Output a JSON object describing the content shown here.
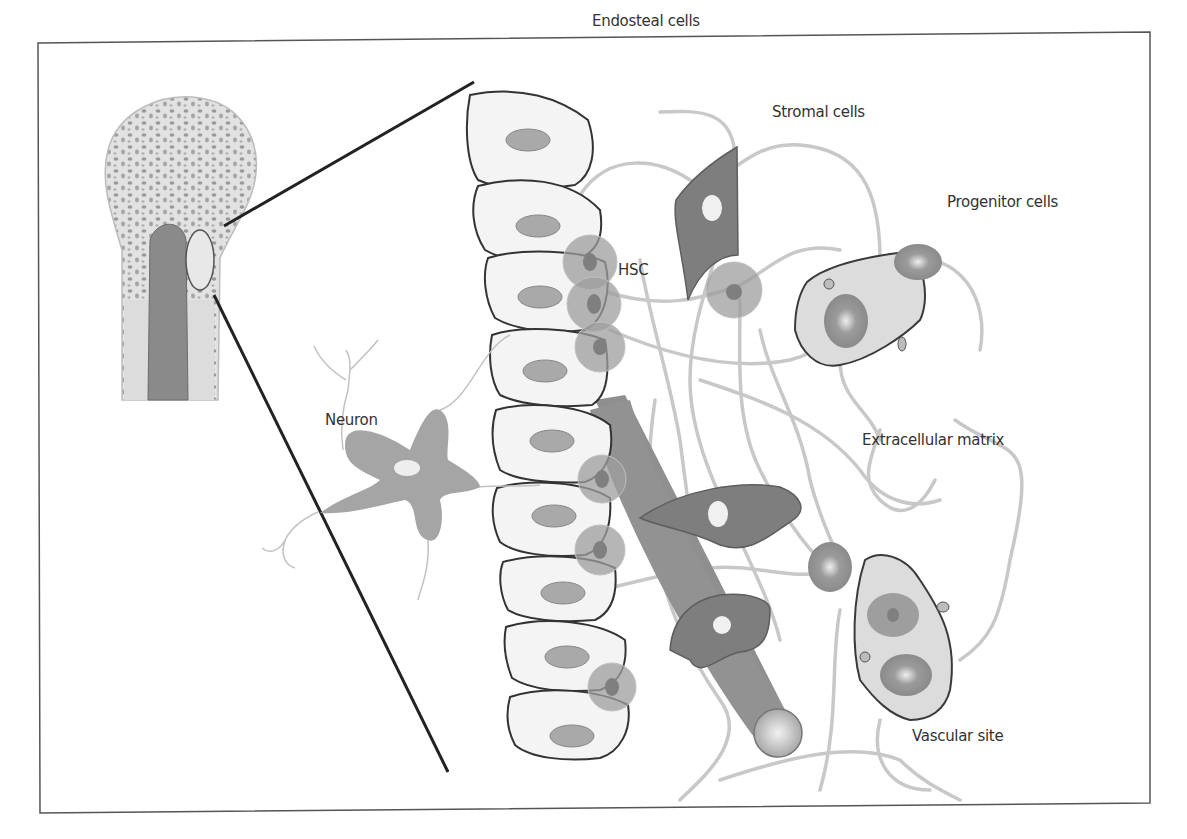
{
  "figure": {
    "type": "illustration",
    "colors": {
      "frame": "#555555",
      "cell_outline": "#3a3a3a",
      "cell_fill": "#f4f4f4",
      "nucleus": "#a9a9a9",
      "hsc": "#9a9a9a",
      "stromal": "#7e7e7e",
      "neuron": "#a5a5a5",
      "fiber": "#c8c8c8",
      "vessel": "#8f8f8f",
      "light_fill": "#dcdcdc"
    },
    "labels": {
      "endosteal": "Endosteal cells",
      "stromal": "Stromal cells",
      "progenitor": "Progenitor cells",
      "hsc": "HSC",
      "neuron": "Neuron",
      "ecm": "Extracellular matrix",
      "vascular": "Vascular site"
    }
  }
}
